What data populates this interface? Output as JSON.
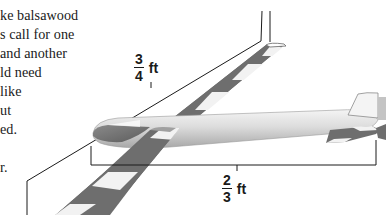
{
  "text_fragment": {
    "lines": [
      "ke balsawood",
      "s call for one",
      "and another",
      "ld need",
      "like",
      "ut",
      "ed.",
      "",
      "r."
    ]
  },
  "diagram": {
    "wing_measurement": {
      "numerator": "3",
      "denominator": "4",
      "unit": "ft"
    },
    "fuselage_measurement": {
      "numerator": "2",
      "denominator": "3",
      "unit": "ft"
    },
    "colors": {
      "stripe_dark": "#6e6e6e",
      "stripe_light": "#f2f2f2",
      "fuselage": "#d9d9d9",
      "line": "#1a1a1a"
    }
  }
}
